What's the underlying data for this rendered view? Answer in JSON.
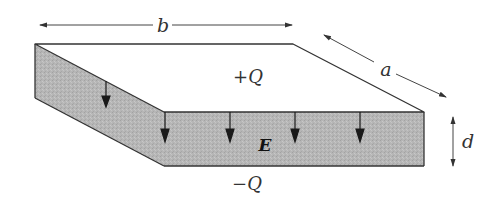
{
  "diagram": {
    "labels": {
      "width": "b",
      "depth": "a",
      "separation": "d",
      "top_charge": "+Q",
      "bottom_charge": "−Q",
      "field": "E"
    },
    "colors": {
      "dielectric_fill": "#b4b4b4",
      "edge_stroke": "#333333",
      "field_arrow": "#1a1a1a",
      "top_plate": "#ffffff",
      "dimension_line": "#444444"
    },
    "field_arrow_count": 6
  }
}
